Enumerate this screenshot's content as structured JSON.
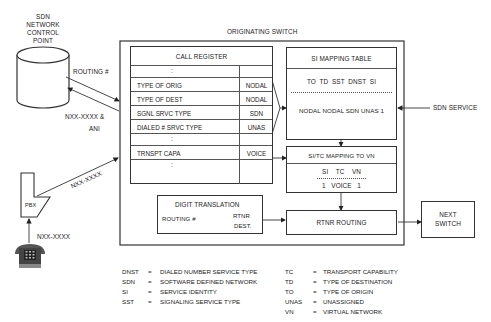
{
  "title": "ORIGINATING SWITCH",
  "ncp": {
    "label_lines": [
      "SDN",
      "NETWORK",
      "CONTROL",
      "POINT"
    ]
  },
  "links": {
    "routing": "ROUTING #",
    "nxx_ani_1": "NXX-XXXX &",
    "nxx_ani_2": "ANI",
    "pbx_to_switch": "NXX-XXXX",
    "phone_to_pbx": "NXX-XXXX",
    "sdn_service": "SDN SERVICE"
  },
  "pbx": {
    "label": "PBX"
  },
  "call_register": {
    "title": "CALL REGISTER",
    "rows": [
      {
        "key": ":",
        "value": ""
      },
      {
        "key": "TYPE OF ORIG",
        "value": "NODAL"
      },
      {
        "key": "TYPE OF DEST",
        "value": "NODAL"
      },
      {
        "key": "SGNL SRVC TYPE",
        "value": "SDN"
      },
      {
        "key": "DIALED # SRVC TYPE",
        "value": "UNAS"
      },
      {
        "key": ":",
        "value": ""
      },
      {
        "key": "TRNSPT CAPA",
        "value": "VOICE"
      },
      {
        "key": ":",
        "value": ""
      }
    ]
  },
  "si_mapping": {
    "title": "SI MAPPING TABLE",
    "header": "TO  TD  SST  DNST  SI",
    "row": "NODAL NODAL SDN UNAS 1"
  },
  "si_tc_mapping": {
    "title": "SI/TC MAPPING TO VN",
    "header": "SI    TC    VN",
    "row": "1   VOICE   1"
  },
  "digit_translation": {
    "title": "DIGIT TRANSLATION",
    "input": "ROUTING #",
    "output_1": "RTNR",
    "output_2": "DEST."
  },
  "rtnr_routing": {
    "label": "RTNR ROUTING"
  },
  "next_switch": {
    "label_1": "NEXT",
    "label_2": "SWITCH"
  },
  "legend": {
    "left": [
      {
        "abbr": "DNST",
        "def": "DIALED NUMBER SERVICE TYPE"
      },
      {
        "abbr": "SDN",
        "def": "SOFTWARE DEFINED NETWORK"
      },
      {
        "abbr": "SI",
        "def": "SERVICE IDENTITY"
      },
      {
        "abbr": "SST",
        "def": "SIGNALING SERVICE TYPE"
      }
    ],
    "right": [
      {
        "abbr": "TC",
        "def": "TRANSPORT CAPABILITY"
      },
      {
        "abbr": "TD",
        "def": "TYPE OF DESTINATION"
      },
      {
        "abbr": "TO",
        "def": "TYPE OF ORIGIN"
      },
      {
        "abbr": "UNAS",
        "def": "UNASSIGNED"
      },
      {
        "abbr": "VN",
        "def": "VIRTUAL NETWORK"
      }
    ],
    "equals": "="
  }
}
